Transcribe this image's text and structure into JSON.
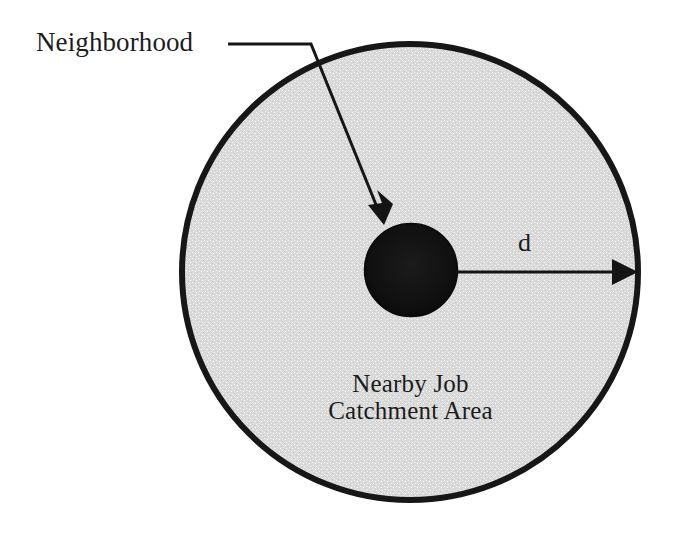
{
  "figure": {
    "background_color": "#ffffff",
    "outline_color": "#1a1a1a",
    "catchment_fill_color": "#d9d9d9",
    "neighborhood_fill_color": "#101010"
  },
  "labels": {
    "neighborhood": "Neighborhood",
    "distance": "d",
    "catchment_line1": "Nearby Job",
    "catchment_line2": "Catchment Area"
  },
  "shapes": {
    "catchment_circle": {
      "name": "Nearby Job Catchment Area",
      "center_x": 410,
      "center_y": 272,
      "radius": 230,
      "stroke_width": 6
    },
    "neighborhood_circle": {
      "name": "Neighborhood",
      "center_x": 411,
      "center_y": 270,
      "radius": 47
    }
  },
  "annotations": {
    "leader": {
      "name": "neighborhood-leader-line",
      "horizontal_start_x": 228,
      "horizontal_end_x": 311,
      "horizontal_y": 44,
      "arrow_tip_x": 384,
      "arrow_tip_y": 223
    },
    "radius_arrow": {
      "name": "distance-radius-arrow",
      "start_x": 456,
      "start_y": 272,
      "end_x": 636,
      "end_y": 272,
      "label": "d"
    }
  },
  "icons": {
    "arrowhead": "arrow-head-icon"
  }
}
